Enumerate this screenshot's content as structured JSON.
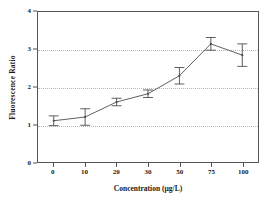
{
  "chart_data": {
    "type": "line",
    "title": "",
    "xlabel": "Concentration (µg/L)",
    "ylabel": "Fluorescence Ratio",
    "categories": [
      "0",
      "10",
      "20",
      "30",
      "50",
      "75",
      "100"
    ],
    "values": [
      1.1,
      1.2,
      1.6,
      1.82,
      2.3,
      3.15,
      2.85
    ],
    "errors": [
      0.13,
      0.22,
      0.1,
      0.1,
      0.22,
      0.17,
      0.3
    ],
    "series": [
      {
        "name": "Fluorescence Ratio",
        "values": [
          1.1,
          1.2,
          1.6,
          1.82,
          2.3,
          3.15,
          2.85
        ],
        "errors": [
          0.13,
          0.22,
          0.1,
          0.1,
          0.22,
          0.17,
          0.3
        ]
      }
    ],
    "ylim": [
      0,
      4
    ],
    "yticks": [
      0,
      1,
      2,
      3,
      4
    ],
    "ytick_labels": [
      "0",
      "1",
      "2",
      "3",
      "4"
    ],
    "gridlines_y": [
      1,
      2,
      3
    ],
    "grid": true,
    "grid_style": "dotted",
    "legend": false,
    "legend_position": "none",
    "line_color": "#4a4a4a",
    "marker_color": "#4a4a4a",
    "errorbar_color": "#4a4a4a",
    "grid_color": "#b9b9b9",
    "axis_color": "#555555",
    "background_color": "#ffffff"
  }
}
